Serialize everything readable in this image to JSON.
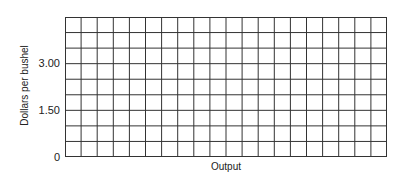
{
  "chart_data": {
    "type": "line",
    "title": "",
    "xlabel": "Output",
    "ylabel": "Dollars per bushel",
    "ylim": [
      0,
      4.5
    ],
    "y_ticks": [
      {
        "value": 0,
        "label": "0"
      },
      {
        "value": 1.5,
        "label": "1.50"
      },
      {
        "value": 3.0,
        "label": "3.00"
      }
    ],
    "x_ticks": [],
    "grid": true,
    "grid_columns": 20,
    "grid_rows": 9,
    "row_step": 0.5,
    "series": []
  },
  "axes": {
    "xlabel": "Output",
    "ylabel": "Dollars per bushel",
    "tick_0": "0",
    "tick_150": "1.50",
    "tick_300": "3.00"
  }
}
